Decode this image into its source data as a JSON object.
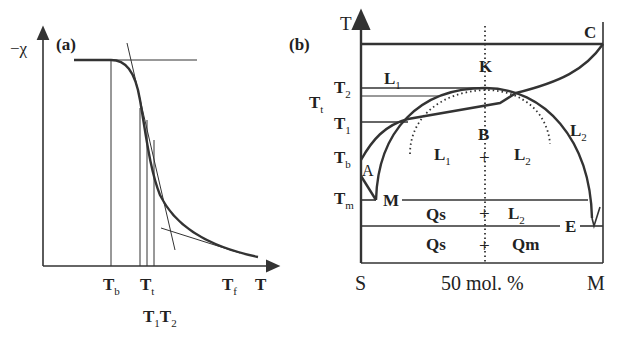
{
  "panel_a": {
    "label": "(a)",
    "y_axis_label": "−χ",
    "x_axis_label": "T",
    "x_ticks": [
      {
        "main": "T",
        "sub": "b"
      },
      {
        "main": "T",
        "sub": "t"
      },
      {
        "main": "T",
        "sub": "f"
      }
    ],
    "bottom_labels": [
      {
        "main": "T",
        "sub": "1"
      },
      {
        "main": "T",
        "sub": "2"
      }
    ]
  },
  "panel_b": {
    "label": "(b)",
    "y_axis_label": "T",
    "temperature_labels": [
      {
        "main": "T",
        "sub": "2"
      },
      {
        "main": "T",
        "sub": "t"
      },
      {
        "main": "T",
        "sub": "1"
      },
      {
        "main": "T",
        "sub": "b"
      },
      {
        "main": "T",
        "sub": "m"
      }
    ],
    "points": {
      "C": "C",
      "K": "K",
      "B": "B",
      "A": "A",
      "M": "M",
      "E": "E"
    },
    "regions": {
      "L1_top": {
        "main": "L",
        "sub": "1"
      },
      "L2_right": {
        "main": "L",
        "sub": "2"
      },
      "L1_dome": {
        "main": "L",
        "sub": "1"
      },
      "plus": "+",
      "L2_dome": {
        "main": "L",
        "sub": "2"
      },
      "Qs_mid": "Qs",
      "L2_mid": {
        "main": "L",
        "sub": "2"
      },
      "Qs_bot": "Qs",
      "Qm_bot": "Qm"
    },
    "x_axis": {
      "left": "S",
      "middle": "50 mol. %",
      "right": "M"
    }
  }
}
